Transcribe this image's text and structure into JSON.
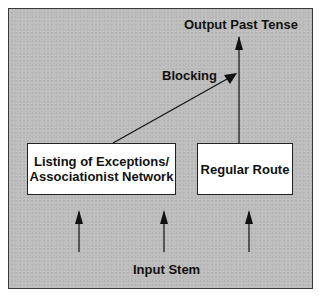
{
  "diagram": {
    "nodes": {
      "output": {
        "label": "Output Past Tense"
      },
      "blocking": {
        "label": "Blocking"
      },
      "exceptions": {
        "line1": "Listing of Exceptions/",
        "line2": "Associationist Network"
      },
      "regular": {
        "label": "Regular Route"
      },
      "input": {
        "label": "Input Stem"
      }
    },
    "edges": [
      {
        "from": "input",
        "to": "exceptions"
      },
      {
        "from": "input",
        "to": "exceptions"
      },
      {
        "from": "input",
        "to": "regular"
      },
      {
        "from": "regular",
        "to": "output"
      },
      {
        "from": "exceptions",
        "to": "output-line",
        "label": "Blocking"
      }
    ],
    "colors": {
      "background": "#bdbdbd",
      "box_fill": "#ffffff",
      "stroke": "#111111"
    }
  }
}
